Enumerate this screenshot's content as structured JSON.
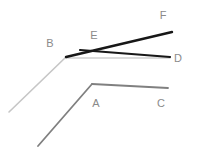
{
  "figure": {
    "title": "",
    "background": "#ffffff",
    "width": 197,
    "height": 149,
    "labels": {
      "A": "A",
      "B": "B",
      "C": "C",
      "D": "D",
      "E": "E",
      "F": "F"
    }
  },
  "chart_data": {
    "type": "line",
    "title": "",
    "xlabel": "",
    "ylabel": "",
    "xlim": [
      0,
      197
    ],
    "ylim": [
      149,
      0
    ],
    "grid": false,
    "legend": "none",
    "note": "Two-segment polylines sharing bend vertices; pixel coordinates, y grows downward.",
    "series": [
      {
        "name": "light-gray-rising-to-B",
        "color": "#c6c6c6",
        "width": 1.6,
        "points": [
          [
            9,
            112
          ],
          [
            66,
            57
          ]
        ]
      },
      {
        "name": "light-gray-B-to-D",
        "color": "#cfcfcf",
        "width": 1.6,
        "points": [
          [
            66,
            58
          ],
          [
            170,
            58
          ]
        ]
      },
      {
        "name": "black-B-to-F",
        "color": "#171717",
        "width": 2.4,
        "points": [
          [
            66,
            57
          ],
          [
            172,
            32
          ]
        ]
      },
      {
        "name": "black-E-to-D",
        "color": "#171717",
        "width": 2.2,
        "points": [
          [
            80,
            50
          ],
          [
            170,
            57
          ]
        ]
      },
      {
        "name": "mid-gray-rising-to-A",
        "color": "#808080",
        "width": 1.8,
        "points": [
          [
            38,
            146
          ],
          [
            92,
            84
          ]
        ]
      },
      {
        "name": "mid-gray-A-to-C",
        "color": "#808080",
        "width": 1.8,
        "points": [
          [
            92,
            84
          ],
          [
            168,
            88
          ]
        ]
      }
    ],
    "annotations": [
      {
        "text": "A",
        "x": 96,
        "y": 107,
        "color": "#8a8a8a"
      },
      {
        "text": "B",
        "x": 50,
        "y": 47,
        "color": "#8a8a8a"
      },
      {
        "text": "C",
        "x": 161,
        "y": 107,
        "color": "#8a8a8a"
      },
      {
        "text": "D",
        "x": 178,
        "y": 62,
        "color": "#555555"
      },
      {
        "text": "E",
        "x": 94,
        "y": 39,
        "color": "#8a8a8a"
      },
      {
        "text": "F",
        "x": 163,
        "y": 19,
        "color": "#555555"
      }
    ]
  }
}
